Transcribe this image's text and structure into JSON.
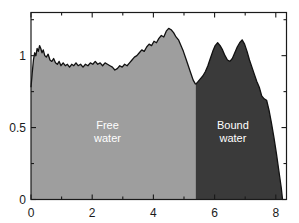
{
  "chart_data": {
    "type": "area",
    "title": "",
    "xlabel": "",
    "ylabel": "",
    "xlim": [
      0,
      8.35
    ],
    "ylim": [
      0,
      1.3
    ],
    "grid": false,
    "legend_position": "inline-annotations",
    "xticks": [
      0,
      2,
      4,
      6,
      8
    ],
    "xtick_labels": [
      "0",
      "2",
      "4",
      "6",
      "8"
    ],
    "xminor_ticks": [
      1,
      3,
      5,
      7
    ],
    "yticks": [
      0,
      0.5,
      1
    ],
    "ytick_labels": [
      "0",
      "0.5",
      "1"
    ],
    "yminor_ticks": [
      0.25,
      0.75,
      1.25
    ],
    "colors": {
      "free_water_fill": "#9e9e9e",
      "bound_water_fill": "#3a3a3a",
      "curve_line": "#111111",
      "axis": "#1a1a1a",
      "background": "#ffffff",
      "label_text": "#ffffff"
    },
    "split_x": 5.38,
    "annotations": [
      {
        "name": "free-water",
        "line1": "Free",
        "line2": "water",
        "x": 2.5,
        "y": 0.47
      },
      {
        "name": "bound-water",
        "line1": "Bound",
        "line2": "water",
        "x": 6.6,
        "y": 0.47
      }
    ],
    "series": [
      {
        "name": "Free water",
        "fill": "#9e9e9e",
        "x": [
          0.0,
          0.04,
          0.08,
          0.12,
          0.16,
          0.2,
          0.24,
          0.28,
          0.32,
          0.36,
          0.4,
          0.45,
          0.5,
          0.56,
          0.62,
          0.68,
          0.74,
          0.8,
          0.86,
          0.92,
          0.98,
          1.05,
          1.12,
          1.19,
          1.26,
          1.33,
          1.4,
          1.47,
          1.54,
          1.62,
          1.7,
          1.78,
          1.86,
          1.94,
          2.02,
          2.1,
          2.18,
          2.26,
          2.34,
          2.42,
          2.5,
          2.58,
          2.66,
          2.74,
          2.82,
          2.9,
          2.98,
          3.06,
          3.14,
          3.22,
          3.3,
          3.38,
          3.46,
          3.54,
          3.62,
          3.7,
          3.78,
          3.86,
          3.94,
          4.02,
          4.1,
          4.18,
          4.26,
          4.34,
          4.42,
          4.5,
          4.58,
          4.66,
          4.74,
          4.82,
          4.9,
          4.98,
          5.06,
          5.14,
          5.22,
          5.3,
          5.38
        ],
        "y": [
          0.78,
          0.88,
          0.97,
          1.02,
          1.0,
          1.05,
          1.03,
          1.07,
          1.05,
          1.02,
          1.04,
          1.0,
          0.99,
          1.01,
          0.97,
          0.96,
          0.98,
          0.95,
          0.94,
          0.96,
          0.93,
          0.95,
          0.93,
          0.94,
          0.92,
          0.94,
          0.93,
          0.95,
          0.93,
          0.94,
          0.92,
          0.94,
          0.93,
          0.95,
          0.94,
          0.96,
          0.94,
          0.95,
          0.93,
          0.95,
          0.94,
          0.93,
          0.92,
          0.9,
          0.91,
          0.93,
          0.92,
          0.94,
          0.93,
          0.95,
          0.97,
          0.99,
          1.0,
          1.02,
          1.04,
          1.03,
          1.06,
          1.08,
          1.07,
          1.1,
          1.09,
          1.12,
          1.14,
          1.13,
          1.17,
          1.19,
          1.18,
          1.16,
          1.13,
          1.11,
          1.07,
          1.03,
          0.98,
          0.93,
          0.88,
          0.83,
          0.8
        ]
      },
      {
        "name": "Bound water",
        "fill": "#3a3a3a",
        "x": [
          5.38,
          5.46,
          5.54,
          5.62,
          5.7,
          5.78,
          5.86,
          5.94,
          6.02,
          6.1,
          6.18,
          6.26,
          6.34,
          6.42,
          6.5,
          6.58,
          6.66,
          6.74,
          6.82,
          6.9,
          6.98,
          7.06,
          7.14,
          7.22,
          7.3,
          7.38,
          7.46,
          7.54,
          7.62,
          7.7,
          7.78,
          7.86,
          7.94,
          8.02,
          8.1,
          8.18,
          8.22
        ],
        "y": [
          0.8,
          0.82,
          0.84,
          0.86,
          0.89,
          0.93,
          0.98,
          1.03,
          1.07,
          1.09,
          1.07,
          1.04,
          1.0,
          0.97,
          0.96,
          0.98,
          1.02,
          1.06,
          1.09,
          1.11,
          1.08,
          1.03,
          0.97,
          0.92,
          0.87,
          0.82,
          0.78,
          0.72,
          0.7,
          0.69,
          0.62,
          0.53,
          0.43,
          0.32,
          0.2,
          0.08,
          0.0
        ]
      }
    ]
  }
}
